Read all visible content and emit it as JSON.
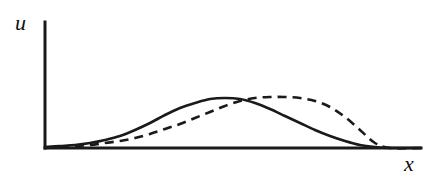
{
  "figure": {
    "background_color": "#ffffff",
    "ink_color": "#1a1a1a",
    "width": 435,
    "height": 181
  },
  "axes": {
    "y_axis": {
      "label": "u",
      "label_name": "y-axis-label",
      "x": 45,
      "y_top": 22,
      "y_bottom": 148,
      "stroke_width": 3
    },
    "x_axis": {
      "label": "x",
      "label_name": "x-axis-label",
      "y": 148,
      "x_left": 45,
      "x_right": 421,
      "stroke_width": 3
    }
  },
  "chart_data": {
    "type": "line",
    "title": "",
    "subtitle": "",
    "xlabel": "x",
    "ylabel": "u",
    "grid": false,
    "legend": null,
    "legend_position": "none",
    "xlim": [
      45,
      421
    ],
    "ylim": [
      148,
      22
    ],
    "axis_units": "pixels (unlabeled schematic axes, no tick marks)",
    "series": [
      {
        "name": "solid-curve",
        "style": "solid",
        "stroke_width": 2.6,
        "dash_pattern": null,
        "color": "#1a1a1a",
        "peak": {
          "x": 228,
          "y": 98
        },
        "x": [
          45,
          60,
          75,
          90,
          105,
          120,
          135,
          150,
          165,
          180,
          195,
          210,
          225,
          240,
          255,
          270,
          285,
          300,
          315,
          330,
          345,
          360,
          375,
          390,
          421
        ],
        "y": [
          147,
          146,
          145,
          143,
          140,
          136,
          130,
          123,
          115,
          108,
          103,
          99,
          98,
          99,
          103,
          109,
          116,
          123,
          130,
          136,
          141,
          145,
          147,
          148,
          148
        ]
      },
      {
        "name": "dashed-curve",
        "style": "dashed",
        "stroke_width": 2.6,
        "dash_pattern": "9 6",
        "color": "#1a1a1a",
        "peak": {
          "x": 284,
          "y": 97
        },
        "x": [
          45,
          60,
          75,
          90,
          105,
          120,
          135,
          150,
          165,
          180,
          195,
          210,
          225,
          240,
          255,
          270,
          285,
          300,
          315,
          330,
          345,
          360,
          375,
          390,
          421
        ],
        "y": [
          148,
          147,
          146,
          145,
          143,
          141,
          138,
          134,
          129,
          124,
          118,
          112,
          106,
          101,
          98,
          97,
          97,
          98,
          101,
          107,
          117,
          130,
          143,
          148,
          148
        ]
      }
    ]
  }
}
